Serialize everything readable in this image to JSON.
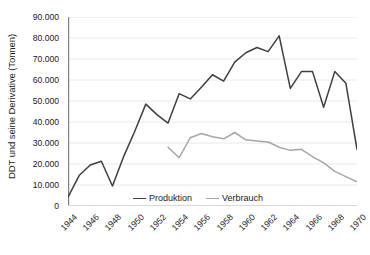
{
  "chart_data": {
    "type": "line",
    "title": "",
    "xlabel": "",
    "ylabel": "DDT und seine Derivative (Tonnen)",
    "xlim": [
      1944,
      1970
    ],
    "ylim": [
      0,
      90000
    ],
    "ytick_step": 10000,
    "xtick_step": 2,
    "grid": true,
    "legend_position": "inside-bottom-center",
    "ytick_labels": [
      "0",
      "10.000",
      "20.000",
      "30.000",
      "40.000",
      "50.000",
      "60.000",
      "70.000",
      "80.000",
      "90.000"
    ],
    "ytick_values": [
      0,
      10000,
      20000,
      30000,
      40000,
      50000,
      60000,
      70000,
      80000,
      90000
    ],
    "xtick_labels": [
      "1944",
      "1946",
      "1948",
      "1950",
      "1952",
      "1954",
      "1956",
      "1958",
      "1960",
      "1962",
      "1964",
      "1966",
      "1968",
      "1970"
    ],
    "xtick_values": [
      1944,
      1946,
      1948,
      1950,
      1952,
      1954,
      1956,
      1958,
      1960,
      1962,
      1964,
      1966,
      1968,
      1970
    ],
    "series": [
      {
        "name": "Produktion",
        "color": "#3f3f3f",
        "x": [
          1944,
          1945,
          1946,
          1947,
          1948,
          1949,
          1950,
          1951,
          1952,
          1953,
          1954,
          1955,
          1956,
          1957,
          1958,
          1959,
          1960,
          1961,
          1962,
          1963,
          1964,
          1965,
          1966,
          1967,
          1968,
          1969,
          1970
        ],
        "values": [
          4200,
          14500,
          19500,
          21300,
          9500,
          23500,
          35500,
          48500,
          43500,
          39500,
          53500,
          51000,
          56500,
          62500,
          59500,
          68500,
          73000,
          75500,
          73500,
          81000,
          56000,
          64000,
          64000,
          47000,
          64000,
          58500,
          27000
        ]
      },
      {
        "name": "Verbrauch",
        "color": "#a6a6a6",
        "x": [
          1953,
          1954,
          1955,
          1956,
          1957,
          1958,
          1959,
          1960,
          1961,
          1962,
          1963,
          1964,
          1965,
          1966,
          1967,
          1968,
          1969,
          1970
        ],
        "values": [
          28000,
          23000,
          32500,
          34500,
          33000,
          32000,
          35000,
          31500,
          31000,
          30500,
          28000,
          26500,
          27000,
          23500,
          20500,
          16500,
          14000,
          11500
        ]
      }
    ]
  },
  "legend": {
    "items": [
      {
        "label": "Produktion",
        "color": "#3f3f3f"
      },
      {
        "label": "Verbrauch",
        "color": "#a6a6a6"
      }
    ]
  }
}
